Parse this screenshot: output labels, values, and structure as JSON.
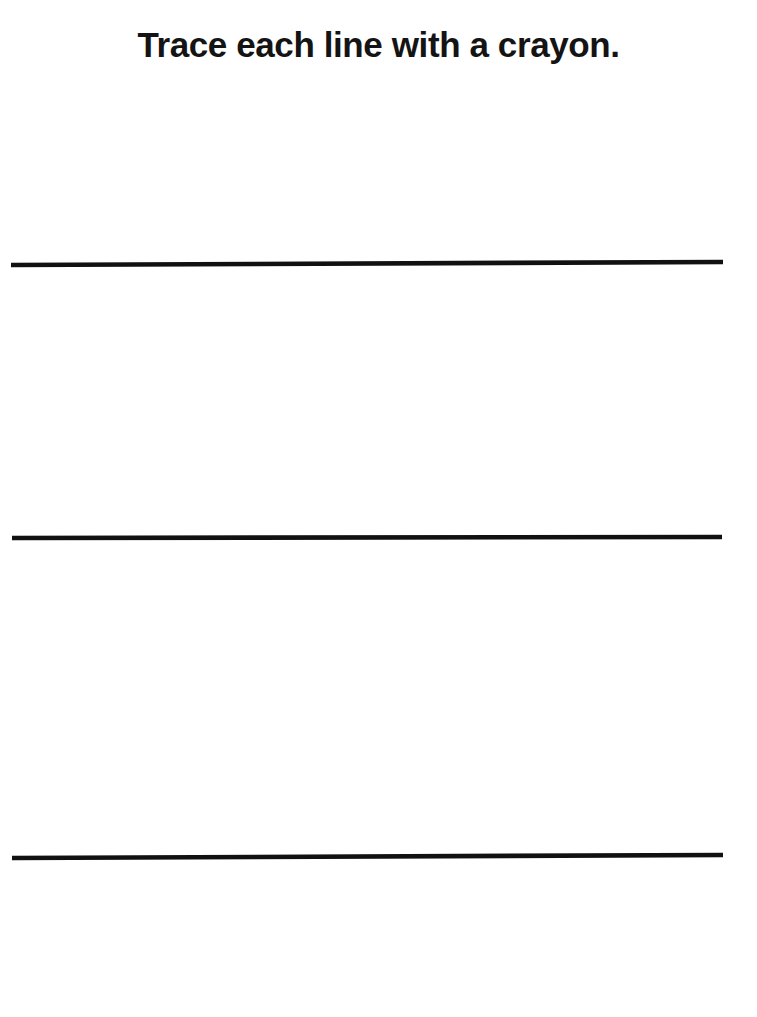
{
  "page": {
    "title": "Trace each line with a crayon.",
    "background_color": "#ffffff",
    "width": 757,
    "height": 1017,
    "type": "handwriting-tracing-worksheet"
  },
  "instruction": {
    "text": "Trace each line with a crayon.",
    "color": "#141414",
    "align": "center"
  },
  "trace_lines": {
    "count": 3,
    "color": "#111111",
    "thickness": "4.6",
    "orientation": "horizontal",
    "items": [
      {
        "label": "trace-line-1",
        "x1": 11,
        "y1": 21,
        "x2": 723,
        "y2": 18,
        "top": 244
      },
      {
        "label": "trace-line-2",
        "x1": 12,
        "y1": 20,
        "x2": 722,
        "y2": 19,
        "top": 518
      },
      {
        "label": "trace-line-3",
        "x1": 12,
        "y1": 20,
        "x2": 723,
        "y2": 17,
        "top": 838
      }
    ]
  }
}
